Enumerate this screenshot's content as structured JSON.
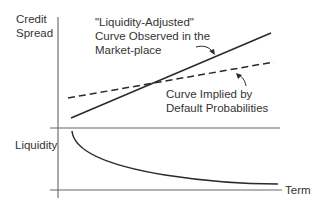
{
  "diagram": {
    "y_axis_top_label_line1": "Credit",
    "y_axis_top_label_line2": "Spread",
    "y_axis_bottom_label": "Liquidity",
    "x_axis_label": "Term",
    "annotation_observed_line1": "\"Liquidity-Adjusted\"",
    "annotation_observed_line2": "Curve Observed in the",
    "annotation_observed_line3": "Market-place",
    "annotation_implied_line1": "Curve Implied by",
    "annotation_implied_line2": "Default Probabilities"
  },
  "colors": {
    "line": "#2a2a2a",
    "axis": "#555555",
    "background": "#ffffff"
  },
  "curves": {
    "observed": {
      "style": "solid",
      "trend": "increasing",
      "start": [
        71,
        118
      ],
      "end": [
        271,
        33
      ]
    },
    "implied": {
      "style": "dashed",
      "trend": "increasing, shallower",
      "start": [
        68,
        98
      ],
      "end": [
        274,
        62
      ]
    },
    "liquidity": {
      "style": "solid",
      "trend": "decreasing convex"
    }
  }
}
